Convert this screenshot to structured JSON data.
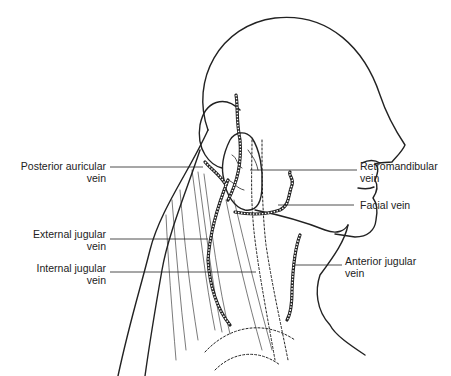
{
  "diagram": {
    "labels": {
      "posterior_auricular": {
        "line1": "Posterior auricular",
        "line2": "vein"
      },
      "external_jugular": {
        "line1": "External jugular",
        "line2": "vein"
      },
      "internal_jugular": {
        "line1": "Internal jugular",
        "line2": "vein"
      },
      "retromandibular": {
        "line1": "Retromandibular",
        "line2": "vein"
      },
      "facial": {
        "line1": "Facial vein"
      },
      "anterior_jugular": {
        "line1": "Anterior jugular",
        "line2": "vein"
      }
    },
    "colors": {
      "ink": "#222222",
      "background": "#ffffff"
    }
  }
}
